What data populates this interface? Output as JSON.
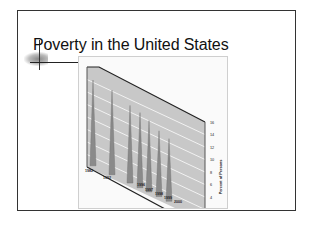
{
  "slide": {
    "title": "Poverty in the United States"
  },
  "chart_data": {
    "type": "bar",
    "style": "3d-spike",
    "title": "Poverty in the United States",
    "categories": [
      "1982",
      "1992",
      "1996",
      "1997",
      "1998",
      "1999",
      "2000"
    ],
    "values": [
      15.0,
      14.8,
      13.7,
      13.3,
      12.7,
      11.8,
      11.3
    ],
    "xlabel": "",
    "ylabel": "Percent of Persons",
    "ylim": [
      0,
      16
    ],
    "yticks": [
      "0",
      "2",
      "4",
      "6",
      "8",
      "10",
      "12",
      "14",
      "16"
    ],
    "grid": true,
    "legend": null
  },
  "colors": {
    "wall": "#c8c8c8",
    "spike": "#8a8a8a",
    "grid": "#f2f2f2",
    "border": "#333333"
  }
}
